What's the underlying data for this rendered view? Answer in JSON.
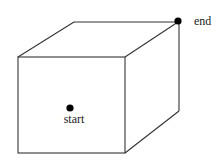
{
  "diagram": {
    "type": "cube-path",
    "colors": {
      "edge": "#333333",
      "point": "#000000",
      "text": "#222222",
      "background": "#ffffff"
    },
    "points": {
      "start": {
        "label": "start"
      },
      "end": {
        "label": "end"
      }
    }
  }
}
